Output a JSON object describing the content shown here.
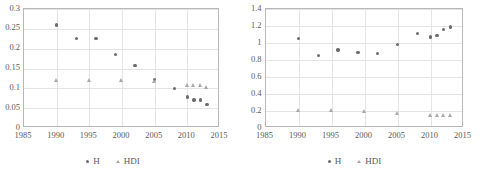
{
  "figure": {
    "background": "#ffffff",
    "axis_color": "#b7b7b7",
    "grid_color": "#e4e4e4",
    "series_colors": {
      "H": "#6b6b6b",
      "HDI": "#a8a8a8"
    }
  },
  "legend": {
    "position": "bottom-center",
    "entries": [
      {
        "label": "H",
        "marker": "circle-marker-icon",
        "color": "#6b6b6b"
      },
      {
        "label": "HDI",
        "marker": "triangle-marker-icon",
        "color": "#a8a8a8"
      }
    ]
  },
  "chart_data": [
    {
      "id": "left-chart",
      "type": "scatter",
      "title": "",
      "subtitle": "",
      "xlabel": "",
      "ylabel": "",
      "xlim": [
        1985,
        2015
      ],
      "ylim": [
        0,
        0.3
      ],
      "grid": true,
      "x_ticks": [
        1985,
        1990,
        1995,
        2000,
        2005,
        2010,
        2015
      ],
      "x_tick_labels": [
        "1985",
        "1990",
        "1995",
        "2000",
        "2005",
        "2010",
        "2015"
      ],
      "y_ticks": [
        0,
        0.05,
        0.1,
        0.15,
        0.2,
        0.25,
        0.3
      ],
      "y_tick_labels": [
        "0",
        "0.05",
        "0.1",
        "0.15",
        "0.2",
        "0.25",
        "0.3"
      ],
      "legend_position": "bottom",
      "series": [
        {
          "name": "H",
          "marker": "circle",
          "color": "#6b6b6b",
          "points": [
            {
              "x": 1990,
              "y": 0.26
            },
            {
              "x": 1993,
              "y": 0.225
            },
            {
              "x": 1996,
              "y": 0.225
            },
            {
              "x": 1999,
              "y": 0.186
            },
            {
              "x": 2002,
              "y": 0.157
            },
            {
              "x": 2005,
              "y": 0.122
            },
            {
              "x": 2008,
              "y": 0.099
            },
            {
              "x": 2010,
              "y": 0.078
            },
            {
              "x": 2011,
              "y": 0.071
            },
            {
              "x": 2012,
              "y": 0.071
            },
            {
              "x": 2013,
              "y": 0.06
            }
          ]
        },
        {
          "name": "HDI",
          "marker": "triangle",
          "color": "#a8a8a8",
          "points": [
            {
              "x": 1990,
              "y": 0.12
            },
            {
              "x": 1995,
              "y": 0.12
            },
            {
              "x": 2000,
              "y": 0.12
            },
            {
              "x": 2005,
              "y": 0.117
            },
            {
              "x": 2010,
              "y": 0.107
            },
            {
              "x": 2011,
              "y": 0.107
            },
            {
              "x": 2012,
              "y": 0.107
            },
            {
              "x": 2013,
              "y": 0.104
            }
          ]
        }
      ]
    },
    {
      "id": "right-chart",
      "type": "scatter",
      "title": "",
      "subtitle": "",
      "xlabel": "",
      "ylabel": "",
      "xlim": [
        1985,
        2015
      ],
      "ylim": [
        0,
        1.4
      ],
      "grid": true,
      "x_ticks": [
        1985,
        1990,
        1995,
        2000,
        2005,
        2010,
        2015
      ],
      "x_tick_labels": [
        "1985",
        "1990",
        "1995",
        "2000",
        "2005",
        "2010",
        "2015"
      ],
      "y_ticks": [
        0,
        0.2,
        0.4,
        0.6,
        0.8,
        1,
        1.2,
        1.4
      ],
      "y_tick_labels": [
        "0",
        "0.2",
        "0.4",
        "0.6",
        "0.8",
        "1",
        "1.2",
        "1.4"
      ],
      "legend_position": "bottom",
      "series": [
        {
          "name": "H",
          "marker": "circle",
          "color": "#6b6b6b",
          "points": [
            {
              "x": 1990,
              "y": 1.05
            },
            {
              "x": 1993,
              "y": 0.85
            },
            {
              "x": 1996,
              "y": 0.92
            },
            {
              "x": 1999,
              "y": 0.89
            },
            {
              "x": 2002,
              "y": 0.88
            },
            {
              "x": 2005,
              "y": 0.98
            },
            {
              "x": 2008,
              "y": 1.11
            },
            {
              "x": 2010,
              "y": 1.07
            },
            {
              "x": 2011,
              "y": 1.09
            },
            {
              "x": 2012,
              "y": 1.16
            },
            {
              "x": 2013,
              "y": 1.19
            }
          ]
        },
        {
          "name": "HDI",
          "marker": "triangle",
          "color": "#a8a8a8",
          "points": [
            {
              "x": 1990,
              "y": 0.21
            },
            {
              "x": 1995,
              "y": 0.205
            },
            {
              "x": 2000,
              "y": 0.195
            },
            {
              "x": 2005,
              "y": 0.175
            },
            {
              "x": 2010,
              "y": 0.155
            },
            {
              "x": 2011,
              "y": 0.155
            },
            {
              "x": 2012,
              "y": 0.155
            },
            {
              "x": 2013,
              "y": 0.155
            }
          ]
        }
      ]
    }
  ]
}
